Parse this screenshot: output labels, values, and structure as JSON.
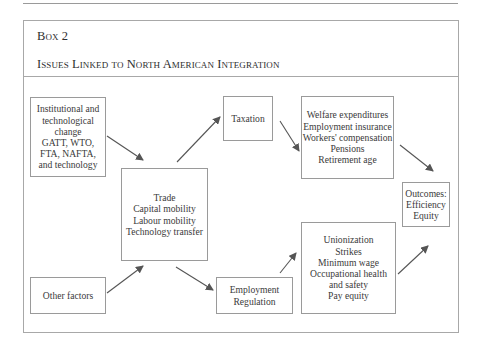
{
  "header": {
    "box_label": "Box 2",
    "title": "Issues Linked to North American Integration"
  },
  "nodes": {
    "institutional": {
      "lines": [
        "Institutional and",
        "technological",
        "change",
        "GATT, WTO,",
        "FTA, NAFTA,",
        "and technology"
      ]
    },
    "other_factors": {
      "lines": [
        "Other factors"
      ]
    },
    "trade": {
      "lines": [
        "Trade",
        "Capital mobility",
        "Labour mobility",
        "Technology transfer"
      ]
    },
    "taxation": {
      "lines": [
        "Taxation"
      ]
    },
    "employment_regulation": {
      "lines": [
        "Employment",
        "Regulation"
      ]
    },
    "welfare": {
      "lines": [
        "Welfare expenditures",
        "Employment insurance",
        "Workers' compensation",
        "Pensions",
        "Retirement age"
      ]
    },
    "labour_issues": {
      "lines": [
        "Unionization",
        "Strikes",
        "Minimum wage",
        "Occupational health",
        "and safety",
        "Pay equity"
      ]
    },
    "outcomes": {
      "lines": [
        "Outcomes:",
        "Efficiency",
        "Equity"
      ]
    }
  },
  "edges": [
    {
      "from": "institutional",
      "to": "trade"
    },
    {
      "from": "other_factors",
      "to": "trade"
    },
    {
      "from": "trade",
      "to": "taxation"
    },
    {
      "from": "trade",
      "to": "employment_regulation"
    },
    {
      "from": "taxation",
      "to": "welfare"
    },
    {
      "from": "employment_regulation",
      "to": "labour_issues"
    },
    {
      "from": "welfare",
      "to": "outcomes"
    },
    {
      "from": "labour_issues",
      "to": "outcomes"
    }
  ],
  "colors": {
    "line": "#9a9a9a",
    "arrow": "#555555",
    "text": "#3a3a3a"
  }
}
